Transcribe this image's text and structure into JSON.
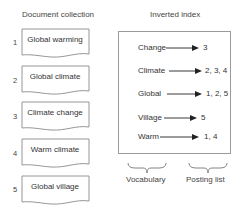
{
  "left_title": "Document collection",
  "right_title": "Inverted index",
  "documents": [
    {
      "id": "1",
      "text": "Global warming"
    },
    {
      "id": "2",
      "text": "Global climate"
    },
    {
      "id": "3",
      "text": "Climate change"
    },
    {
      "id": "4",
      "text": "Warm climate"
    },
    {
      "id": "5",
      "text": "Global village"
    }
  ],
  "index": [
    {
      "term": "Change",
      "postings": "3"
    },
    {
      "term": "Climate",
      "postings": "2, 3, 4"
    },
    {
      "term": "Global",
      "postings": "1, 2, 5"
    },
    {
      "term": "Village",
      "postings": "5"
    },
    {
      "term": "Warm",
      "postings": "1, 4"
    }
  ],
  "brace_labels": {
    "vocabulary": "Vocabulary",
    "posting_list": "Posting list"
  },
  "colors": {
    "stroke": "#8a8a8a",
    "text": "#333333",
    "arrow": "#222222"
  }
}
